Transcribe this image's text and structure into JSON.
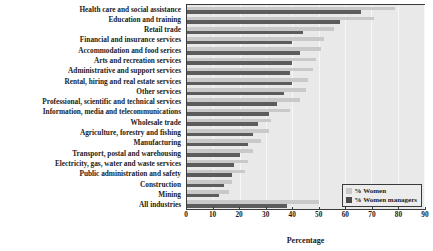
{
  "chart_data": {
    "type": "bar",
    "orientation": "horizontal",
    "title": "",
    "xlabel": "Percentage",
    "ylabel": "",
    "xlim": [
      0,
      90
    ],
    "xticks": [
      0,
      10,
      20,
      30,
      40,
      50,
      60,
      70,
      80,
      90
    ],
    "grid": true,
    "legend_position": "bottom-right",
    "categories": [
      "Health care and social assistance",
      "Education and training",
      "Retail trade",
      "Financial and insurance services",
      "Accommodation and food serices",
      "Arts and recreation services",
      "Administrative and support services",
      "Rental, hiring and real estate services",
      "Other services",
      "Professional, scientific and technical  services",
      "Information, media and telecommunications",
      "Wholesale trade",
      "Agriculture, forestry and fishing",
      "Manufacturing",
      "Transport, postal and warehousing",
      "Electricity, gas, water and waste services",
      "Public administration and safety",
      "Construction",
      "Mining",
      "All industries"
    ],
    "series": [
      {
        "name": "% Women",
        "color": "#c9c9c9",
        "values": [
          79,
          71,
          56,
          52,
          51,
          49,
          48,
          46,
          45,
          43,
          39,
          32,
          31,
          28,
          25,
          23,
          22,
          17,
          16,
          50
        ]
      },
      {
        "name": "% Women managers",
        "color": "#5c5c5c",
        "values": [
          66,
          58,
          44,
          40,
          43,
          40,
          39,
          40,
          37,
          34,
          31,
          27,
          25,
          23,
          20,
          18,
          17,
          14,
          12,
          38
        ]
      }
    ]
  },
  "legend": {
    "items": [
      {
        "label": "% Women",
        "color": "#c9c9c9"
      },
      {
        "label": "% Women managers",
        "color": "#4a4a4a"
      }
    ]
  },
  "axis": {
    "x_title": "Percentage",
    "x_tick_labels": [
      "0",
      "10",
      "20",
      "30",
      "40",
      "50",
      "60",
      "70",
      "80",
      "90"
    ]
  }
}
